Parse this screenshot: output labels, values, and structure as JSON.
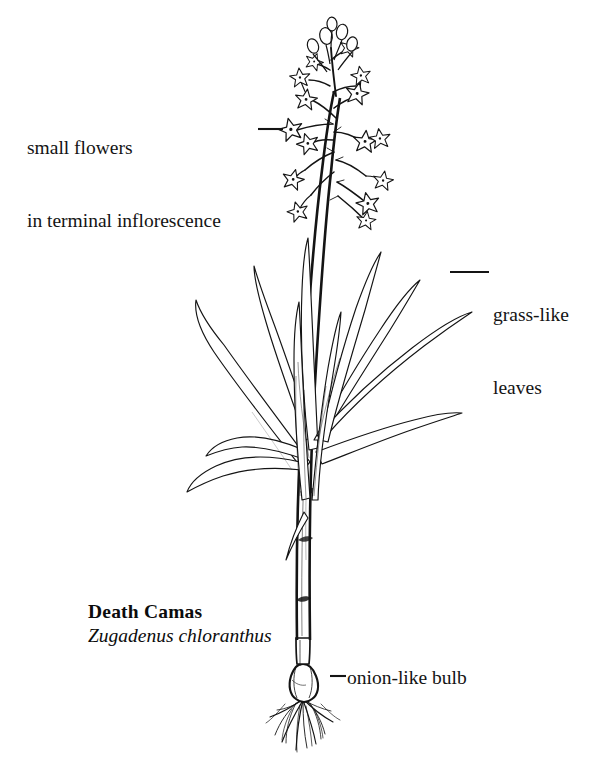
{
  "figure": {
    "kind": "botanical-line-illustration",
    "background_color": "#ffffff",
    "ink_color": "#111111",
    "width": 601,
    "height": 770
  },
  "annotations": {
    "flowers": {
      "line1": "small flowers",
      "line2": "in terminal inflorescence",
      "leader": "em-dash leader line pointing right to a flower"
    },
    "leaves": {
      "line1": "grass-like",
      "line2": "leaves",
      "leader": "short rule pointing left to a leaf blade"
    },
    "bulb": {
      "text": "onion-like bulb",
      "leader": "em-dash leader line pointing left to the bulb"
    }
  },
  "identification": {
    "common_name": "Death Camas",
    "scientific_name": "Zugadenus chloranthus"
  },
  "plant_parts": [
    "terminal inflorescence of small star-shaped flowers",
    "unopened oval buds at apex",
    "slender branching pedicels",
    "erect central stem",
    "long narrow grass-like basal leaves",
    "rounded onion-like bulb",
    "fibrous roots"
  ]
}
